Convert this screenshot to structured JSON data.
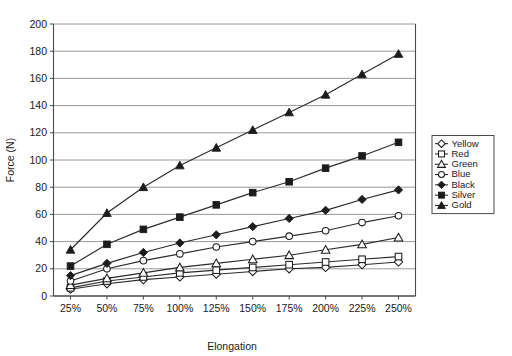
{
  "chart_data": {
    "type": "line",
    "title": "",
    "xlabel": "Elongation",
    "ylabel": "Force (N)",
    "categories": [
      "25%",
      "50%",
      "75%",
      "100%",
      "125%",
      "150%",
      "175%",
      "200%",
      "225%",
      "250%"
    ],
    "ylim": [
      0,
      200
    ],
    "yticks": [
      0,
      20,
      40,
      60,
      80,
      100,
      120,
      140,
      160,
      180,
      200
    ],
    "grid": "horizontal",
    "legend_position": "right",
    "series": [
      {
        "name": "Yellow",
        "marker": "open-diamond",
        "color": "#1c1c1c",
        "values": [
          5,
          9,
          12,
          14,
          16,
          18,
          20,
          21,
          23,
          25
        ]
      },
      {
        "name": "Red",
        "marker": "open-square",
        "color": "#1c1c1c",
        "values": [
          6,
          11,
          14,
          17,
          19,
          21,
          23,
          25,
          27,
          29
        ]
      },
      {
        "name": "Green",
        "marker": "open-triangle",
        "color": "#1c1c1c",
        "values": [
          8,
          13,
          17,
          21,
          24,
          27,
          30,
          34,
          38,
          43
        ]
      },
      {
        "name": "Blue",
        "marker": "open-circle",
        "color": "#1c1c1c",
        "values": [
          11,
          20,
          26,
          31,
          36,
          40,
          44,
          48,
          54,
          59
        ]
      },
      {
        "name": "Black",
        "marker": "filled-diamond",
        "color": "#1c1c1c",
        "values": [
          15,
          24,
          32,
          39,
          45,
          51,
          57,
          63,
          71,
          78
        ]
      },
      {
        "name": "Silver",
        "marker": "filled-square",
        "color": "#1c1c1c",
        "values": [
          22,
          38,
          49,
          58,
          67,
          76,
          84,
          94,
          103,
          113
        ]
      },
      {
        "name": "Gold",
        "marker": "filled-triangle",
        "color": "#1c1c1c",
        "values": [
          34,
          61,
          80,
          96,
          109,
          122,
          135,
          148,
          163,
          178
        ]
      }
    ]
  },
  "axes": {
    "y_tick_labels": [
      "0",
      "20",
      "40",
      "60",
      "80",
      "100",
      "120",
      "140",
      "160",
      "180",
      "200"
    ],
    "x_tick_labels": [
      "25%",
      "50%",
      "75%",
      "100%",
      "125%",
      "150%",
      "175%",
      "200%",
      "225%",
      "250%"
    ],
    "y_axis_title": "Force (N)",
    "x_axis_title": "Elongation"
  },
  "legend": {
    "entries": [
      {
        "label": "Yellow",
        "marker": "open-diamond"
      },
      {
        "label": "Red",
        "marker": "open-square"
      },
      {
        "label": "Green",
        "marker": "open-triangle"
      },
      {
        "label": "Blue",
        "marker": "open-circle"
      },
      {
        "label": "Black",
        "marker": "filled-diamond"
      },
      {
        "label": "Silver",
        "marker": "filled-square"
      },
      {
        "label": "Gold",
        "marker": "filled-triangle"
      }
    ]
  }
}
